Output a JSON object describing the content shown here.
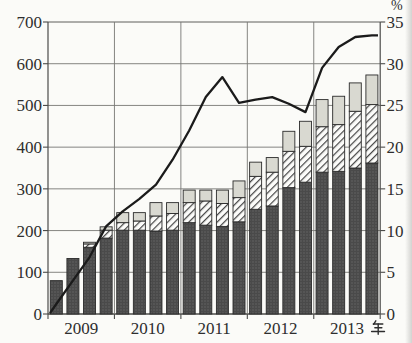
{
  "figure": {
    "background": "#fbfbf8",
    "title": "",
    "left_axis": {
      "tick_labels": [
        "0",
        "100",
        "200",
        "300",
        "400",
        "500",
        "600",
        "700"
      ],
      "min": 0,
      "max": 700,
      "step": 100
    },
    "right_axis": {
      "unit_label": "%",
      "tick_labels": [
        "0",
        "5",
        "10",
        "15",
        "20",
        "25",
        "30",
        "35"
      ],
      "min": 0,
      "max": 35,
      "step": 5
    },
    "x_axis": {
      "year_labels": [
        "2009",
        "2010",
        "2011",
        "2012",
        "2013"
      ],
      "unit_label": "年",
      "bars_per_year": 4
    }
  },
  "chart_data": {
    "type": "bar",
    "subtype": "stacked-bar-with-line",
    "categories": [
      "2009-1",
      "2009-2",
      "2009-3",
      "2009-4",
      "2010-1",
      "2010-2",
      "2010-3",
      "2010-4",
      "2011-1",
      "2011-2",
      "2011-3",
      "2011-4",
      "2012-1",
      "2012-2",
      "2012-3",
      "2012-4",
      "2013-1",
      "2013-2",
      "2013-3",
      "2013-4"
    ],
    "grid": true,
    "left_ylim": [
      0,
      700
    ],
    "right_ylim": [
      0,
      35
    ],
    "series": [
      {
        "name": "bar-segment-dark-dotted",
        "axis": "left",
        "stack": 1,
        "values": [
          80,
          133,
          160,
          182,
          201,
          201,
          199,
          201,
          219,
          213,
          210,
          221,
          251,
          259,
          303,
          316,
          340,
          342,
          350,
          362
        ]
      },
      {
        "name": "bar-segment-white-hatched",
        "axis": "left",
        "stack": 2,
        "values": [
          0,
          0,
          8,
          19,
          18,
          22,
          36,
          40,
          48,
          58,
          55,
          58,
          79,
          81,
          87,
          86,
          109,
          112,
          136,
          140
        ]
      },
      {
        "name": "bar-segment-light-gray",
        "axis": "left",
        "stack": 3,
        "values": [
          0,
          0,
          4,
          8,
          24,
          20,
          32,
          26,
          30,
          26,
          32,
          40,
          34,
          35,
          48,
          60,
          65,
          68,
          68,
          71
        ]
      }
    ],
    "bar_totals": [
      80,
      133,
      172,
      209,
      243,
      243,
      267,
      267,
      297,
      297,
      297,
      319,
      364,
      375,
      438,
      462,
      514,
      522,
      554,
      573
    ],
    "line_series": {
      "name": "percentage-trend-line",
      "axis": "right",
      "start_value": 0.1,
      "values": [
        1.2,
        4.0,
        6.8,
        10.5,
        12.3,
        13.8,
        15.5,
        18.5,
        22.0,
        26.0,
        28.4,
        25.3,
        25.7,
        26.0,
        25.2,
        24.2,
        29.5,
        32.0,
        33.2,
        33.4
      ],
      "end_value": 33.4
    }
  },
  "colors": {
    "background": "#fbfbf8",
    "bar_dark": "#4a4a4a",
    "bar_dark_dot": "#686868",
    "bar_hatch_bg": "#fcfcfa",
    "bar_hatch_stroke": "#454545",
    "bar_gray": "#d9d9d1",
    "bar_outline": "#2b2b2b",
    "grid": "#777774",
    "frame": "#4c4c4a",
    "line": "#1b1b1b",
    "text": "#2e2e2e"
  }
}
